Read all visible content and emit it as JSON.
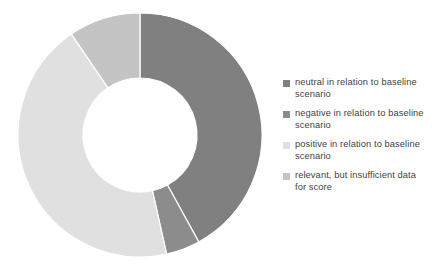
{
  "chart_data": {
    "type": "pie",
    "variant": "donut",
    "title": "",
    "subtitle": "",
    "xlabel": "",
    "ylabel": "",
    "grid": false,
    "legend_position": "right",
    "start_angle_deg": 0,
    "direction": "clockwise",
    "inner_radius_ratio": 0.47,
    "categories": [
      "neutral in relation to baseline scenario",
      "negative in relation to baseline scenario",
      "positive in relation to baseline scenario",
      "relevant, but insufficient data for score"
    ],
    "values": [
      42,
      4.5,
      44,
      9.5
    ],
    "units": "percent",
    "colors": [
      "#808080",
      "#8c8c8c",
      "#e0e0e0",
      "#c4c4c4"
    ],
    "slices": [
      {
        "label": "neutral in relation to baseline scenario",
        "value": 42,
        "color": "#808080",
        "start_angle_deg": 0,
        "end_angle_deg": 151.2
      },
      {
        "label": "negative in relation to baseline scenario",
        "value": 4.5,
        "color": "#8c8c8c",
        "start_angle_deg": 151.2,
        "end_angle_deg": 167.4
      },
      {
        "label": "positive in relation to baseline scenario",
        "value": 44,
        "color": "#e0e0e0",
        "start_angle_deg": 167.4,
        "end_angle_deg": 325.8
      },
      {
        "label": "relevant, but insufficient data for score",
        "value": 9.5,
        "color": "#c4c4c4",
        "start_angle_deg": 325.8,
        "end_angle_deg": 360
      }
    ]
  },
  "legend": {
    "items": [
      {
        "label": "neutral in relation to baseline scenario",
        "color": "#808080"
      },
      {
        "label": "negative in relation to baseline scenario",
        "color": "#8c8c8c"
      },
      {
        "label": "positive in relation to baseline scenario",
        "color": "#e0e0e0"
      },
      {
        "label": "relevant, but insufficient data for score",
        "color": "#c4c4c4"
      }
    ]
  },
  "style": {
    "background": "#ffffff",
    "slice_border_color": "#ffffff",
    "legend_text_color": "#3f3f3f"
  }
}
